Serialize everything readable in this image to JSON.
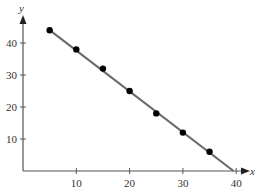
{
  "chart_data": {
    "type": "scatter",
    "title": "",
    "xlabel": "x",
    "ylabel": "y",
    "xlim": [
      0,
      42
    ],
    "ylim": [
      0,
      48
    ],
    "grid": false,
    "x_ticks": [
      10,
      20,
      30,
      40
    ],
    "y_ticks": [
      10,
      20,
      30,
      40
    ],
    "x_tick_labels": [
      "10",
      "20",
      "30",
      "40"
    ],
    "y_tick_labels": [
      "10",
      "20",
      "30",
      "40"
    ],
    "series": [
      {
        "name": "data points",
        "x": [
          5,
          10,
          15,
          20,
          25,
          30,
          35
        ],
        "y": [
          44,
          38,
          32,
          25,
          18,
          12,
          6
        ]
      }
    ],
    "fit_line": {
      "name": "best fit line",
      "x": [
        5,
        39.5
      ],
      "y": [
        44,
        0
      ]
    },
    "colors": {
      "points": "#000000",
      "line": "#6b6b6b",
      "axes": "#555555"
    }
  }
}
